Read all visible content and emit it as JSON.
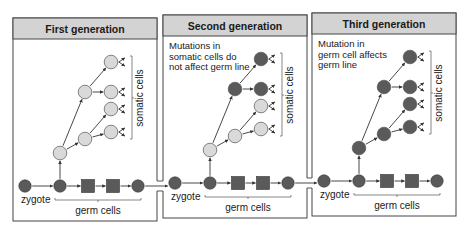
{
  "figure": {
    "panels": [
      {
        "title": "First generation",
        "note_lines": [],
        "somatic_label": "somatic cells",
        "zygote_label": "zygote",
        "germ_label": "germ cells",
        "somatic_cells": {
          "root": "normal",
          "upper_branch": "normal",
          "lower_branch": "normal",
          "leaves": [
            "normal",
            "normal",
            "normal",
            "normal"
          ]
        }
      },
      {
        "title": "Second generation",
        "note_lines": [
          "Mutations in",
          "somatic cells do",
          "not affect germ line"
        ],
        "somatic_label": "somatic cells",
        "zygote_label": "zygote",
        "germ_label": "germ cells",
        "somatic_cells": {
          "root": "normal",
          "upper_branch": "mutant",
          "lower_branch": "normal",
          "leaves": [
            "mutant",
            "mutant",
            "normal",
            "normal"
          ]
        }
      },
      {
        "title": "Third generation",
        "note_lines": [
          "Mutation in",
          "germ cell affects",
          "germ line"
        ],
        "somatic_label": "somatic cells",
        "zygote_label": "zygote",
        "germ_label": "germ cells",
        "somatic_cells": {
          "root": "mutant",
          "upper_branch": "mutant",
          "lower_branch": "mutant",
          "leaves": [
            "mutant",
            "mutant",
            "mutant",
            "mutant"
          ]
        }
      }
    ],
    "colors": {
      "mutant_cell": "#5a5a5a",
      "normal_cell": "#d9d9d9",
      "germ_cell": "#5a5a5a",
      "header_fill": "#d3d3d3",
      "line": "#333333"
    }
  }
}
